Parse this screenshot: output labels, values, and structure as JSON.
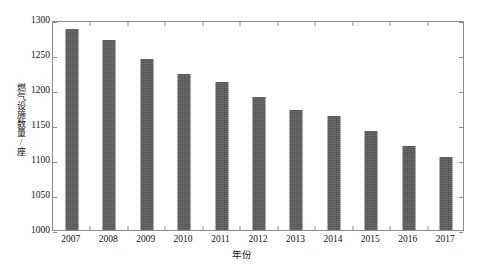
{
  "chart_data": {
    "type": "bar",
    "title": "",
    "subtitle": "",
    "xlabel": "年份",
    "ylabel": "燃气设施数量/座",
    "categories": [
      "2007",
      "2008",
      "2009",
      "2010",
      "2011",
      "2012",
      "2013",
      "2014",
      "2015",
      "2016",
      "2017"
    ],
    "values": [
      1287,
      1271,
      1245,
      1223,
      1212,
      1190,
      1172,
      1163,
      1142,
      1120,
      1104
    ],
    "series": [
      {
        "name": "燃气设施数量",
        "values": [
          1287,
          1271,
          1245,
          1223,
          1212,
          1190,
          1172,
          1163,
          1142,
          1120,
          1104
        ]
      }
    ],
    "ylim": [
      1000,
      1300
    ],
    "ytick_labels": [
      "1000",
      "1050",
      "1100",
      "1150",
      "1200",
      "1250",
      "1300"
    ],
    "ytick_values": [
      1000,
      1050,
      1100,
      1150,
      1200,
      1250,
      1300
    ],
    "xtick_labels": [
      "2007",
      "2008",
      "2009",
      "2010",
      "2011",
      "2012",
      "2013",
      "2014",
      "2015",
      "2016",
      "2017"
    ],
    "grid": false,
    "legend": false,
    "legend_position": "none",
    "bar_color": "#5e5e5e",
    "frame_color": "#8c8c8c",
    "background_color": "#ffffff",
    "annotations": []
  }
}
